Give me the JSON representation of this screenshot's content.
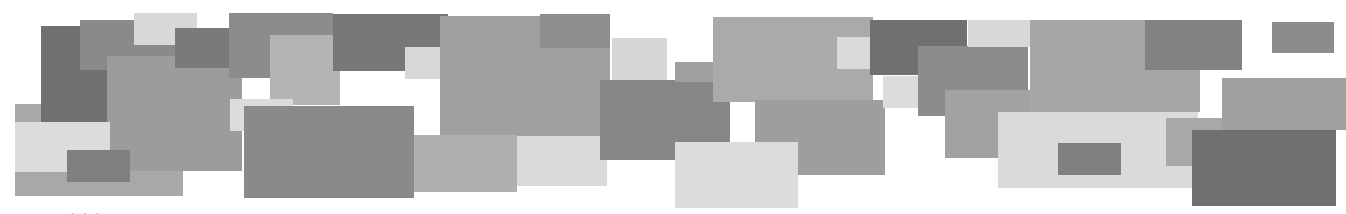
{
  "graphic": {
    "background": "#ffffff",
    "rects": [
      {
        "x": 15,
        "y": 104,
        "w": 168,
        "h": 92,
        "c": "#a8a8a8"
      },
      {
        "x": 41,
        "y": 26,
        "w": 66,
        "h": 96,
        "c": "#707070"
      },
      {
        "x": 80,
        "y": 20,
        "w": 95,
        "h": 50,
        "c": "#8a8a8a"
      },
      {
        "x": 134,
        "y": 13,
        "w": 63,
        "h": 32,
        "c": "#d8d8d8"
      },
      {
        "x": 107,
        "y": 56,
        "w": 135,
        "h": 115,
        "c": "#9c9c9c"
      },
      {
        "x": 175,
        "y": 28,
        "w": 120,
        "h": 40,
        "c": "#7a7a7a"
      },
      {
        "x": 15,
        "y": 122,
        "w": 95,
        "h": 50,
        "c": "#dcdcdc"
      },
      {
        "x": 67,
        "y": 150,
        "w": 63,
        "h": 32,
        "c": "#808080"
      },
      {
        "x": 229,
        "y": 13,
        "w": 104,
        "h": 65,
        "c": "#8c8c8c"
      },
      {
        "x": 270,
        "y": 35,
        "w": 70,
        "h": 70,
        "c": "#b4b4b4"
      },
      {
        "x": 230,
        "y": 99,
        "w": 63,
        "h": 32,
        "c": "#dcdcdc"
      },
      {
        "x": 244,
        "y": 106,
        "w": 170,
        "h": 92,
        "c": "#8a8a8a"
      },
      {
        "x": 333,
        "y": 14,
        "w": 115,
        "h": 57,
        "c": "#787878"
      },
      {
        "x": 405,
        "y": 47,
        "w": 62,
        "h": 32,
        "c": "#d8d8d8"
      },
      {
        "x": 440,
        "y": 24,
        "w": 95,
        "h": 71,
        "c": "#848484"
      },
      {
        "x": 440,
        "y": 16,
        "w": 170,
        "h": 120,
        "c": "#a0a0a0"
      },
      {
        "x": 540,
        "y": 14,
        "w": 70,
        "h": 34,
        "c": "#8e8e8e"
      },
      {
        "x": 414,
        "y": 135,
        "w": 103,
        "h": 57,
        "c": "#b0b0b0"
      },
      {
        "x": 517,
        "y": 136,
        "w": 90,
        "h": 50,
        "c": "#dadada"
      },
      {
        "x": 600,
        "y": 80,
        "w": 130,
        "h": 80,
        "c": "#868686"
      },
      {
        "x": 612,
        "y": 38,
        "w": 55,
        "h": 42,
        "c": "#d6d6d6"
      },
      {
        "x": 675,
        "y": 62,
        "w": 40,
        "h": 20,
        "c": "#a0a0a0"
      },
      {
        "x": 713,
        "y": 17,
        "w": 160,
        "h": 85,
        "c": "#aaaaaa"
      },
      {
        "x": 755,
        "y": 100,
        "w": 130,
        "h": 75,
        "c": "#9e9e9e"
      },
      {
        "x": 675,
        "y": 142,
        "w": 123,
        "h": 66,
        "c": "#dcdcdc"
      },
      {
        "x": 837,
        "y": 37,
        "w": 63,
        "h": 32,
        "c": "#dadada"
      },
      {
        "x": 870,
        "y": 20,
        "w": 97,
        "h": 55,
        "c": "#707070"
      },
      {
        "x": 883,
        "y": 76,
        "w": 35,
        "h": 32,
        "c": "#dcdcdc"
      },
      {
        "x": 918,
        "y": 46,
        "w": 110,
        "h": 70,
        "c": "#8c8c8c"
      },
      {
        "x": 945,
        "y": 90,
        "w": 120,
        "h": 68,
        "c": "#a2a2a2"
      },
      {
        "x": 968,
        "y": 20,
        "w": 62,
        "h": 27,
        "c": "#d8d8d8"
      },
      {
        "x": 1030,
        "y": 20,
        "w": 170,
        "h": 92,
        "c": "#a6a6a6"
      },
      {
        "x": 998,
        "y": 112,
        "w": 200,
        "h": 76,
        "c": "#dadada"
      },
      {
        "x": 1058,
        "y": 143,
        "w": 63,
        "h": 32,
        "c": "#808080"
      },
      {
        "x": 1145,
        "y": 20,
        "w": 97,
        "h": 50,
        "c": "#828282"
      },
      {
        "x": 1166,
        "y": 118,
        "w": 100,
        "h": 48,
        "c": "#a8a8a8"
      },
      {
        "x": 1222,
        "y": 78,
        "w": 124,
        "h": 52,
        "c": "#a0a0a0"
      },
      {
        "x": 1272,
        "y": 22,
        "w": 62,
        "h": 31,
        "c": "#8c8c8c"
      },
      {
        "x": 1192,
        "y": 130,
        "w": 144,
        "h": 76,
        "c": "#707070"
      }
    ]
  },
  "caption": {
    "text": "· · ·"
  }
}
